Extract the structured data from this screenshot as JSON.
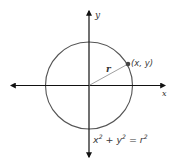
{
  "diagram": {
    "type": "unit-circle-equation",
    "colors": {
      "axis": "#111111",
      "circle": "#555555",
      "radius_line": "#777777",
      "point": "#444444",
      "text": "#333333"
    },
    "axes": {
      "x_label": "x",
      "y_label": "y"
    },
    "circle": {
      "center": [
        89,
        85
      ],
      "radius": 44
    },
    "radius_label": "r",
    "point_label": "(x, y)",
    "equation": {
      "x_term": "x",
      "x_exp": "2",
      "plus": "+",
      "y_term": "y",
      "y_exp": "2",
      "equals": "=",
      "r_term": "r",
      "r_exp": "2"
    }
  }
}
